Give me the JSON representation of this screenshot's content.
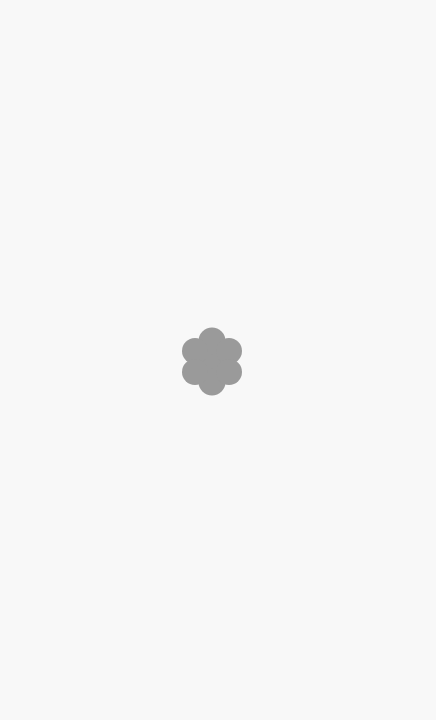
{
  "screen": {
    "state": "loading",
    "background_color": "#f8f8f8"
  },
  "loading_indicator": {
    "icon": "flower-spinner-icon",
    "shape": "six-lobed flower",
    "color": "#9a9a9a",
    "label": ""
  }
}
